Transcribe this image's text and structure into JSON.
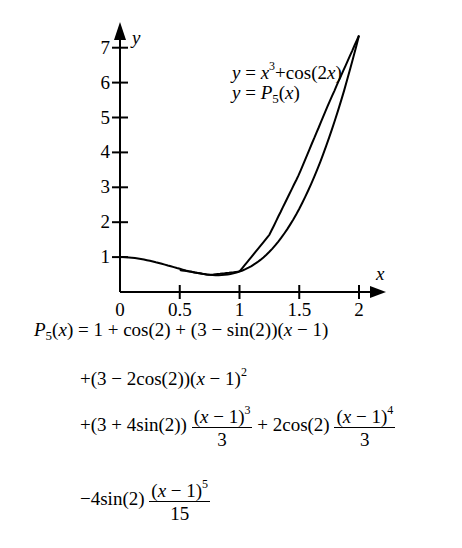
{
  "chart_data": {
    "type": "line",
    "title": "",
    "xlabel": "x",
    "ylabel": "y",
    "xlim": [
      0,
      2.1
    ],
    "ylim": [
      0,
      7.4
    ],
    "xticks": [
      0,
      0.5,
      1,
      1.5,
      2
    ],
    "xtick_labels": [
      "0",
      "0.5",
      "1",
      "1.5",
      "2"
    ],
    "yticks": [
      1,
      2,
      3,
      4,
      5,
      6,
      7
    ],
    "ytick_labels": [
      "1",
      "2",
      "3",
      "4",
      "5",
      "6",
      "7"
    ],
    "grid": false,
    "legend_position": "upper-center",
    "series": [
      {
        "name": "y = x^3 + cos(2x)",
        "x": [
          0,
          0.25,
          0.5,
          0.75,
          1.0,
          1.25,
          1.5,
          1.75,
          2.0
        ],
        "values": [
          1.0,
          0.893,
          0.665,
          0.493,
          0.584,
          1.638,
          3.385,
          5.43,
          7.35
        ]
      },
      {
        "name": "y = P5(x)",
        "x": [
          0.5,
          0.75,
          1.0,
          1.25,
          1.5,
          1.75,
          2.0
        ],
        "values": [
          0.63,
          0.49,
          0.584,
          1.638,
          3.385,
          5.43,
          7.35
        ]
      }
    ]
  },
  "legend": {
    "line1": {
      "lhs": "y",
      "eq": " = ",
      "x": "x",
      "exp": "3",
      "rest": "+cos(2",
      "x2": "x",
      "close": ")"
    },
    "line2": {
      "lhs": "y",
      "eq": " = ",
      "P": "P",
      "sub": "5",
      "open": "(",
      "x": "x",
      "close": ")"
    }
  },
  "formula": {
    "line1": {
      "P": "P",
      "sub": "5",
      "arg": "(",
      "x": "x",
      "rest1": ")",
      "eq": " = 1 + cos(2) + (3 − sin(2))(",
      "x2": "x",
      "rest2": " − 1)"
    },
    "line2": {
      "pre": "+(3 − 2cos(2))(",
      "x": "x",
      "post": " − 1)",
      "exp": "2"
    },
    "line3": {
      "pre": "+(3 + 4sin(2))",
      "num1_open": "(",
      "num1_x": "x",
      "num1_close": " − 1)",
      "num1_exp": "3",
      "den1": "3",
      "mid": " + 2cos(2)",
      "num2_open": "(",
      "num2_x": "x",
      "num2_close": " − 1)",
      "num2_exp": "4",
      "den2": "3"
    },
    "line4": {
      "pre": "−4sin(2)",
      "num_open": "(",
      "num_x": "x",
      "num_close": " − 1)",
      "num_exp": "5",
      "den": "15"
    }
  }
}
